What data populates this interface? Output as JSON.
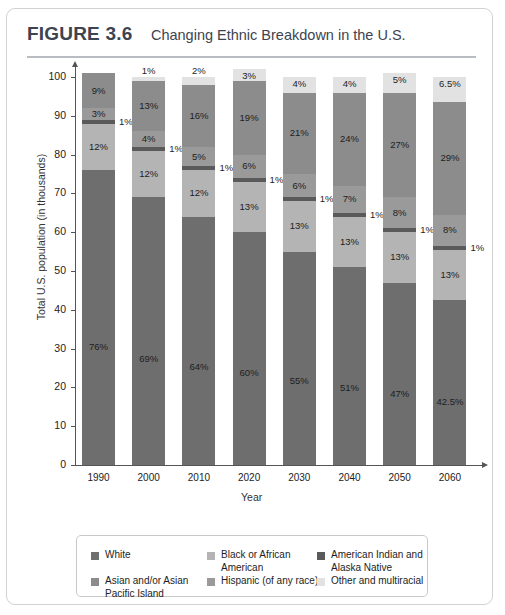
{
  "figure": {
    "number": "FIGURE 3.6",
    "title": "Changing Ethnic Breakdown in the U.S."
  },
  "chart_data": {
    "type": "bar",
    "subtype": "stacked-bar-100",
    "title": "Changing Ethnic Breakdown in the U.S.",
    "xlabel": "Year",
    "ylabel": "Total U.S. population (in thousands)",
    "ylim": [
      0,
      100
    ],
    "yticks": [
      0,
      10,
      20,
      30,
      40,
      50,
      60,
      70,
      80,
      90,
      100
    ],
    "grid": false,
    "legend_position": "bottom",
    "categories": [
      "1990",
      "2000",
      "2010",
      "2020",
      "2030",
      "2040",
      "2050",
      "2060"
    ],
    "stack_order_bottom_to_top": [
      "White",
      "Hispanic (of any race)",
      "American Indian and Alaska Native",
      "Asian and/or Asian Pacific Island",
      "Black or African American",
      "Other and multiracial"
    ],
    "series": [
      {
        "name": "White",
        "color": "#6e6e6e",
        "values": [
          76,
          69,
          64,
          60,
          55,
          51,
          47,
          42.5
        ],
        "labels": [
          "76%",
          "69%",
          "64%",
          "60%",
          "55%",
          "51%",
          "47%",
          "42.5%"
        ]
      },
      {
        "name": "Hispanic (of any race)",
        "color": "#b4b4b4",
        "values": [
          12,
          12,
          12,
          13,
          13,
          13,
          13,
          13
        ],
        "labels": [
          "12%",
          "12%",
          "12%",
          "13%",
          "13%",
          "13%",
          "13%",
          "13%"
        ]
      },
      {
        "name": "American Indian and Alaska Native",
        "color": "#5a5a5a",
        "values": [
          1,
          1,
          1,
          1,
          1,
          1,
          1,
          1
        ],
        "labels": [
          "1%",
          "1%",
          "1%",
          "1%",
          "1%",
          "1%",
          "1%",
          "1%"
        ]
      },
      {
        "name": "Asian and/or Asian Pacific Island",
        "color": "#9a9a9a",
        "values": [
          3,
          4,
          5,
          6,
          6,
          7,
          8,
          8
        ],
        "labels": [
          "3%",
          "4%",
          "5%",
          "6%",
          "6%",
          "7%",
          "8%",
          "8%"
        ]
      },
      {
        "name": "Black or African American",
        "color": "#8c8c8c",
        "values": [
          9,
          13,
          16,
          19,
          21,
          24,
          27,
          29
        ],
        "labels": [
          "9%",
          "13%",
          "16%",
          "19%",
          "21%",
          "24%",
          "27%",
          "29%"
        ]
      },
      {
        "name": "Other and multiracial",
        "color": "#e2e2e2",
        "values": [
          0,
          1,
          2,
          3,
          4,
          4,
          5,
          6.5
        ],
        "labels": [
          "",
          "1%",
          "2%",
          "3%",
          "4%",
          "4%",
          "5%",
          "6.5%"
        ]
      }
    ],
    "notes": {
      "top_label_1990": "9%",
      "american_indian_callout": "1%"
    }
  },
  "legend": {
    "items": [
      {
        "label": "White",
        "color": "#6e6e6e"
      },
      {
        "label": "Black or African American",
        "color": "#b4b4b4"
      },
      {
        "label": "American Indian and Alaska Native",
        "color": "#5a5a5a"
      },
      {
        "label": "Asian and/or Asian Pacific Island",
        "color": "#8c8c8c"
      },
      {
        "label": "Hispanic (of any race)",
        "color": "#9a9a9a"
      },
      {
        "label": "Other and multiracial",
        "color": "#e2e2e2"
      }
    ]
  },
  "colors": {
    "white_seg": "#6e6e6e",
    "hispanic_seg": "#b4b4b4",
    "american_indian_seg": "#5a5a5a",
    "asian_seg": "#9a9a9a",
    "black_seg": "#8c8c8c",
    "other_seg": "#e2e2e2",
    "rule": "#b9bcc2",
    "text": "#3d4450"
  }
}
